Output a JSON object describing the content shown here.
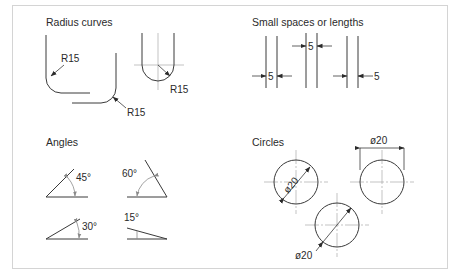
{
  "diagram": {
    "sections": [
      {
        "id": "radius-curves",
        "title": "Radius curves",
        "labels": [
          "R15",
          "R15",
          "R15"
        ]
      },
      {
        "id": "small-spaces",
        "title": "Small spaces or lengths",
        "labels": [
          "5",
          "5",
          "5"
        ]
      },
      {
        "id": "angles",
        "title": "Angles",
        "labels": [
          "45°",
          "60°",
          "30°",
          "15°"
        ]
      },
      {
        "id": "circles",
        "title": "Circles",
        "labels": [
          "ø20",
          "ø20",
          "ø20"
        ]
      }
    ],
    "colors": {
      "line": "#3a3a3a",
      "centerline": "#9a9a9a",
      "angle_arc": "#8a8a8a",
      "frame": "#d4d4d4",
      "background": "#ffffff"
    }
  }
}
